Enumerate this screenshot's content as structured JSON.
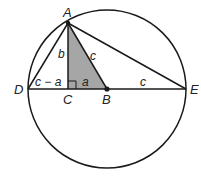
{
  "diagram": {
    "points": {
      "A": "A",
      "B": "B",
      "C": "C",
      "D": "D",
      "E": "E"
    },
    "segment_labels": {
      "AC": "b",
      "AB": "c",
      "DC": "c − a",
      "CB": "a",
      "BE": "c"
    },
    "colors": {
      "line": "#1a1a1a",
      "shaded_triangle": "#a6a6a6"
    }
  }
}
